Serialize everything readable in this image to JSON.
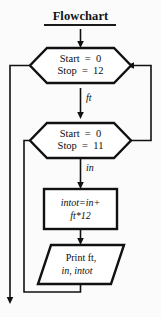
{
  "diagram": {
    "title": "Flowchart",
    "background_color": "#fbfbfb",
    "line_color": "#111111",
    "text_color": "#0d0d0d",
    "nodes": [
      {
        "id": "outer-loop",
        "type": "hexagon",
        "line1": "Start  =  0",
        "line2": "Stop  =  12"
      },
      {
        "id": "inner-loop",
        "type": "hexagon",
        "line1": "Start  =  0",
        "line2": "Stop  =  11"
      },
      {
        "id": "process",
        "type": "rectangle",
        "line1": "intot=in+",
        "line2": "ft*12"
      },
      {
        "id": "output",
        "type": "parallelogram",
        "line1": "Print ft,",
        "line2": "in, intot"
      }
    ],
    "edge_labels": [
      {
        "id": "ft-label",
        "text": "ft"
      },
      {
        "id": "in-label",
        "text": "in"
      }
    ]
  }
}
